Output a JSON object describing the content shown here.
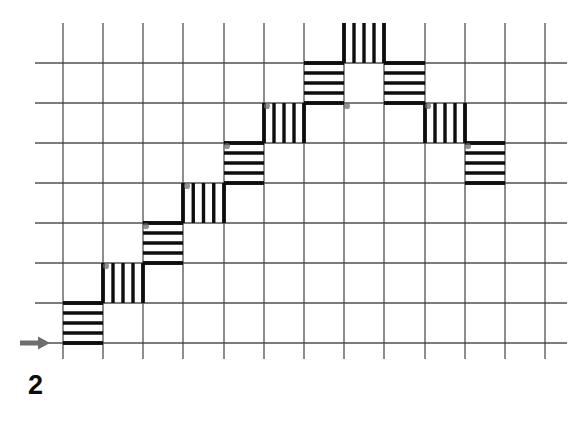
{
  "figure": {
    "caption": "2",
    "background_color": "#ffffff",
    "grid_line_color": "#3a3a3a",
    "block_line_color": "#0d0d0d",
    "arrow_color": "#6e6e6e",
    "marker_color": "#6e6e6e"
  },
  "chart_data": {
    "type": "bar",
    "title": "",
    "subtitle": "",
    "xlabel": "",
    "ylabel": "",
    "grid": true,
    "legend": null,
    "axis_note": "Square grid background; staircase profile drawn as alternating hatched cells",
    "grid_geometry": {
      "x_start": 63,
      "y_start": 63,
      "cell_width": 40.2,
      "cell_height": 40.0,
      "columns": 12,
      "rows": 7,
      "x_ticks": [
        63,
        103,
        143,
        183,
        224,
        264,
        304,
        344,
        384,
        425,
        465,
        505,
        545
      ],
      "y_ticks": [
        63,
        103,
        143,
        183,
        223,
        263,
        303,
        343
      ]
    },
    "categories": [
      1,
      2,
      3,
      4,
      5,
      6,
      7,
      8,
      9,
      10,
      11,
      12
    ],
    "values": [
      1,
      2,
      3,
      4,
      5,
      6,
      7,
      7,
      6,
      5,
      4,
      3
    ],
    "ylim": [
      0,
      7
    ],
    "xlim": [
      0,
      12
    ],
    "annotations": [
      {
        "name": "start-arrow",
        "shape": "arrow-right",
        "x": 20,
        "y": 343,
        "length": 28
      }
    ],
    "blocks": [
      {
        "id": 1,
        "hatch": "horizontal",
        "col": 0,
        "row_top": 6,
        "x": 63,
        "y": 303,
        "w": 40,
        "h": 40
      },
      {
        "id": 2,
        "hatch": "vertical",
        "col": 1,
        "row_top": 5,
        "x": 103,
        "y": 263,
        "w": 40,
        "h": 40
      },
      {
        "id": 3,
        "hatch": "horizontal",
        "col": 2,
        "row_top": 4,
        "x": 143,
        "y": 223,
        "w": 40,
        "h": 40
      },
      {
        "id": 4,
        "hatch": "vertical",
        "col": 3,
        "row_top": 3,
        "x": 183,
        "y": 183,
        "w": 41,
        "h": 40
      },
      {
        "id": 5,
        "hatch": "horizontal",
        "col": 4,
        "row_top": 2,
        "x": 224,
        "y": 143,
        "w": 40,
        "h": 40
      },
      {
        "id": 6,
        "hatch": "vertical",
        "col": 5,
        "row_top": 1,
        "x": 264,
        "y": 103,
        "w": 40,
        "h": 40
      },
      {
        "id": 7,
        "hatch": "horizontal",
        "col": 6,
        "row_top": 0,
        "x": 304,
        "y": 63,
        "w": 40,
        "h": 40
      },
      {
        "id": 8,
        "hatch": "vertical",
        "col": 7,
        "row_top": -1,
        "x": 344,
        "y": 23,
        "w": 40,
        "h": 40
      },
      {
        "id": 9,
        "hatch": "horizontal",
        "col": 8,
        "row_top": 0,
        "x": 384,
        "y": 63,
        "w": 41,
        "h": 40
      },
      {
        "id": 10,
        "hatch": "vertical",
        "col": 9,
        "row_top": 1,
        "x": 425,
        "y": 103,
        "w": 40,
        "h": 40
      },
      {
        "id": 11,
        "hatch": "horizontal",
        "col": 10,
        "row_top": 2,
        "x": 465,
        "y": 143,
        "w": 40,
        "h": 40
      }
    ],
    "corner_markers": [
      {
        "x": 106,
        "y": 266
      },
      {
        "x": 146,
        "y": 226
      },
      {
        "x": 187,
        "y": 186
      },
      {
        "x": 227,
        "y": 146
      },
      {
        "x": 267,
        "y": 106
      },
      {
        "x": 347,
        "y": 106
      },
      {
        "x": 428,
        "y": 106
      },
      {
        "x": 468,
        "y": 146
      }
    ]
  }
}
